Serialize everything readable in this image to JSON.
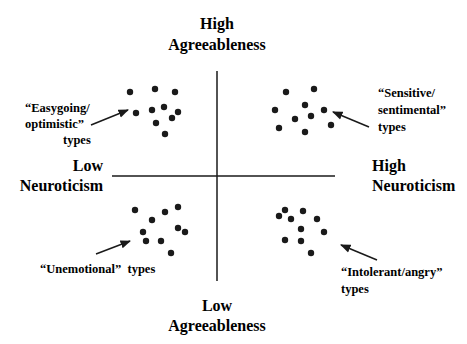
{
  "chart_data": {
    "type": "scatter",
    "title": "",
    "axes": {
      "vertical": {
        "top_label": [
          "High",
          "Agreeableness"
        ],
        "bottom_label": [
          "Low",
          "Agreeableness"
        ]
      },
      "horizontal": {
        "left_label": [
          "Low",
          "Neuroticism"
        ],
        "right_label": [
          "High",
          "Neuroticism"
        ]
      }
    },
    "grid": false,
    "quadrants": [
      {
        "name": "top-left",
        "label": [
          "“Easygoing/",
          "optimistic”",
          "types"
        ],
        "points": [
          [
            130,
            92
          ],
          [
            155,
            89
          ],
          [
            175,
            92
          ],
          [
            136,
            113
          ],
          [
            152,
            110
          ],
          [
            164,
            107
          ],
          [
            178,
            112
          ],
          [
            172,
            118
          ],
          [
            156,
            123
          ],
          [
            165,
            134
          ]
        ],
        "arrow": {
          "from": [
            91,
            125
          ],
          "to": [
            128,
            110
          ]
        }
      },
      {
        "name": "top-right",
        "label": [
          "“Sensitive/",
          "sentimental”",
          "types"
        ],
        "points": [
          [
            286,
            92
          ],
          [
            314,
            89
          ],
          [
            275,
            110
          ],
          [
            305,
            105
          ],
          [
            324,
            110
          ],
          [
            295,
            119
          ],
          [
            311,
            116
          ],
          [
            279,
            128
          ],
          [
            305,
            132
          ],
          [
            331,
            125
          ]
        ],
        "arrow": {
          "from": [
            369,
            127
          ],
          "to": [
            333,
            112
          ]
        }
      },
      {
        "name": "bottom-left",
        "label": [
          "“Unemotional”  types"
        ],
        "points": [
          [
            135,
            210
          ],
          [
            152,
            220
          ],
          [
            165,
            212
          ],
          [
            178,
            207
          ],
          [
            143,
            232
          ],
          [
            146,
            241
          ],
          [
            161,
            241
          ],
          [
            178,
            228
          ],
          [
            185,
            232
          ],
          [
            171,
            253
          ]
        ],
        "arrow": {
          "from": [
            96,
            254
          ],
          "to": [
            130,
            241
          ]
        }
      },
      {
        "name": "bottom-right",
        "label": [
          "“Intolerant/angry”",
          "types"
        ],
        "points": [
          [
            285,
            210
          ],
          [
            279,
            216
          ],
          [
            291,
            219
          ],
          [
            303,
            211
          ],
          [
            317,
            219
          ],
          [
            301,
            229
          ],
          [
            324,
            232
          ],
          [
            285,
            240
          ],
          [
            301,
            241
          ],
          [
            311,
            253
          ]
        ],
        "arrow": {
          "from": [
            377,
            260
          ],
          "to": [
            341,
            245
          ]
        }
      }
    ]
  },
  "colors": {
    "ink": "#1a1a1a",
    "background": "#ffffff"
  }
}
